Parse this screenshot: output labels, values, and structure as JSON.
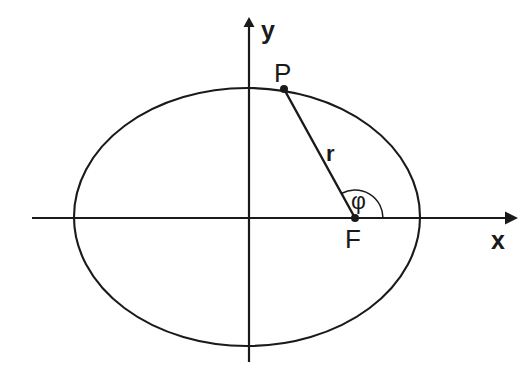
{
  "figure": {
    "kind": "ellipse-polar-coordinates-diagram",
    "background_color": "#ffffff",
    "stroke_color": "#1a1a1a",
    "width": 532,
    "height": 375
  },
  "axes": {
    "x_label": "x",
    "y_label": "y",
    "origin": {
      "x": 247,
      "y": 218
    },
    "x_axis": {
      "x_start": 32,
      "x_end": 512,
      "y": 218,
      "arrow": "right"
    },
    "y_axis": {
      "x": 249,
      "y_start": 19,
      "y_end": 362,
      "arrow": "up"
    }
  },
  "ellipse": {
    "center_x": 247,
    "center_y": 217,
    "semi_major_a": 173,
    "semi_minor_b": 129,
    "left_vertex_x": 74,
    "right_vertex_x": 420,
    "top_vertex_y": 88,
    "bottom_vertex_y": 346
  },
  "points": {
    "P": {
      "label": "P",
      "x": 284,
      "y": 89,
      "label_x": 274,
      "label_y": 60
    },
    "F": {
      "label": "F",
      "x": 355,
      "y": 218,
      "label_x": 345,
      "label_y": 226
    }
  },
  "radius": {
    "label": "r",
    "from": "F",
    "to": "P",
    "label_x": 326,
    "label_y": 143
  },
  "angle": {
    "label": "φ",
    "vertex": "F",
    "arc_radius": 28,
    "from_deg": 0,
    "to_deg": 119,
    "label_x": 351,
    "label_y": 190
  }
}
